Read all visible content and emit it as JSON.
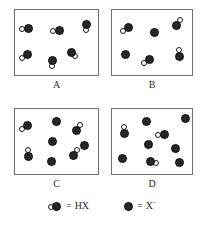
{
  "figure": {
    "title": "",
    "width": 207,
    "height": 234,
    "colors": {
      "background": "#ffffff",
      "box_border": "#6f6f70",
      "x_atom_fill": "#262626",
      "h_atom_fill": "#ffffff",
      "atom_outline": "#111111",
      "text": "#2b2b2b"
    }
  },
  "chart_data": {
    "type": "diagram",
    "title": "",
    "xlabel": "",
    "ylabel": "",
    "legend_position": "bottom",
    "grid": false,
    "categories": [
      "A",
      "B",
      "C",
      "D"
    ],
    "series": [
      {
        "name": "HX",
        "values": [
          6,
          4,
          4,
          3
        ]
      },
      {
        "name": "X⁻",
        "values": [
          0,
          2,
          4,
          6
        ]
      }
    ],
    "panels": [
      {
        "label": "A",
        "hx_count": 6,
        "x_ion_count": 2,
        "total_particles": 6,
        "box": {
          "x": 14,
          "y": 9,
          "w": 85,
          "h": 67
        },
        "label_pos": {
          "x": 14,
          "y": 80
        },
        "species": [
          {
            "kind": "HX",
            "x": 9,
            "y": 14,
            "orientation": "h-left"
          },
          {
            "kind": "HX",
            "x": 40,
            "y": 16,
            "orientation": "h-left"
          },
          {
            "kind": "HX",
            "x": 67,
            "y": 10,
            "orientation": "v-bottom"
          },
          {
            "kind": "HX",
            "x": 8,
            "y": 40,
            "orientation": "diag-bl"
          },
          {
            "kind": "HX",
            "x": 33,
            "y": 46,
            "orientation": "v-bottom"
          },
          {
            "kind": "HX",
            "x": 52,
            "y": 38,
            "orientation": "diag-br"
          }
        ]
      },
      {
        "label": "B",
        "hx_count": 4,
        "x_ion_count": 2,
        "total_particles": 6,
        "box": {
          "x": 111,
          "y": 9,
          "w": 82,
          "h": 67
        },
        "label_pos": {
          "x": 111,
          "y": 80
        },
        "species": [
          {
            "kind": "HX",
            "x": 12,
            "y": 13,
            "orientation": "diag-bl"
          },
          {
            "kind": "X",
            "x": 38,
            "y": 18
          },
          {
            "kind": "HX",
            "x": 60,
            "y": 11,
            "orientation": "diag-tr"
          },
          {
            "kind": "X",
            "x": 9,
            "y": 40
          },
          {
            "kind": "HX",
            "x": 33,
            "y": 45,
            "orientation": "diag-bl"
          },
          {
            "kind": "HX",
            "x": 63,
            "y": 42,
            "orientation": "v-top"
          }
        ]
      },
      {
        "label": "C",
        "hx_count": 4,
        "x_ion_count": 4,
        "total_particles": 8,
        "box": {
          "x": 14,
          "y": 108,
          "w": 85,
          "h": 67
        },
        "label_pos": {
          "x": 14,
          "y": 178
        },
        "species": [
          {
            "kind": "HX",
            "x": 8,
            "y": 12,
            "orientation": "diag-bl"
          },
          {
            "kind": "X",
            "x": 37,
            "y": 8
          },
          {
            "kind": "HX",
            "x": 57,
            "y": 17,
            "orientation": "diag-tr"
          },
          {
            "kind": "X",
            "x": 33,
            "y": 28
          },
          {
            "kind": "X",
            "x": 65,
            "y": 32
          },
          {
            "kind": "HX",
            "x": 9,
            "y": 43,
            "orientation": "v-top"
          },
          {
            "kind": "X",
            "x": 32,
            "y": 48
          },
          {
            "kind": "HX",
            "x": 54,
            "y": 42,
            "orientation": "diag-tr"
          }
        ]
      },
      {
        "label": "D",
        "hx_count": 3,
        "x_ion_count": 6,
        "total_particles": 9,
        "box": {
          "x": 111,
          "y": 108,
          "w": 82,
          "h": 67
        },
        "label_pos": {
          "x": 111,
          "y": 178
        },
        "species": [
          {
            "kind": "X",
            "x": 30,
            "y": 8
          },
          {
            "kind": "X",
            "x": 69,
            "y": 5
          },
          {
            "kind": "HX",
            "x": 8,
            "y": 20,
            "orientation": "v-top"
          },
          {
            "kind": "HX",
            "x": 48,
            "y": 21,
            "orientation": "h-left"
          },
          {
            "kind": "X",
            "x": 32,
            "y": 31
          },
          {
            "kind": "X",
            "x": 59,
            "y": 35
          },
          {
            "kind": "X",
            "x": 6,
            "y": 45
          },
          {
            "kind": "HX",
            "x": 34,
            "y": 48,
            "orientation": "h-right"
          },
          {
            "kind": "X",
            "x": 63,
            "y": 49
          }
        ]
      }
    ]
  },
  "legend": {
    "y": 200,
    "entries": [
      {
        "glyph": "hx-molecule-glyph",
        "equals": "=",
        "label": "HX",
        "label_sup": "",
        "x": 48
      },
      {
        "glyph": "x-ion-glyph",
        "equals": "=",
        "label": "X",
        "label_sup": "−",
        "x": 124
      }
    ]
  },
  "labels": {
    "panel_a": "A",
    "panel_b": "B",
    "panel_c": "C",
    "panel_d": "D"
  }
}
